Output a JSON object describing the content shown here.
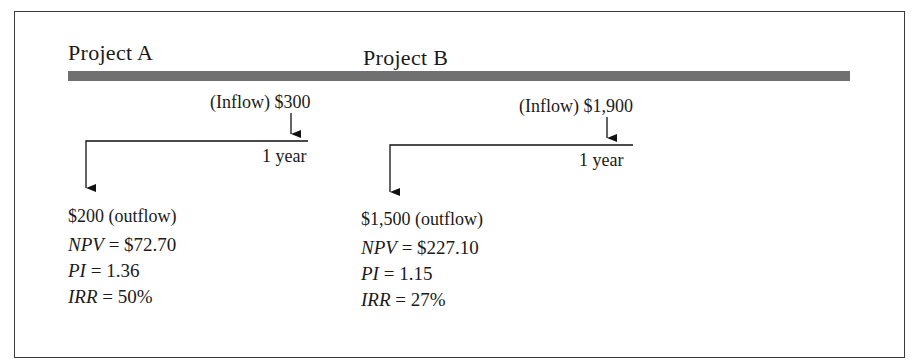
{
  "projects": [
    {
      "title": "Project A",
      "inflow_label": "(Inflow) $300",
      "period_label": "1 year",
      "outflow_label": "$200 (outflow)",
      "metrics": [
        {
          "name": "NPV",
          "value": "= $72.70"
        },
        {
          "name": "PI",
          "value": "= 1.36"
        },
        {
          "name": "IRR",
          "value": "= 50%"
        }
      ]
    },
    {
      "title": "Project B",
      "inflow_label": "(Inflow) $1,900",
      "period_label": "1 year",
      "outflow_label": "$1,500 (outflow)",
      "metrics": [
        {
          "name": "NPV",
          "value": "= $227.10"
        },
        {
          "name": "PI",
          "value": "= 1.15"
        },
        {
          "name": "IRR",
          "value": "= 27%"
        }
      ]
    }
  ],
  "colors": {
    "frame": "#3a3a3a",
    "header_bar": "#707070",
    "text": "#1a1a1a"
  }
}
